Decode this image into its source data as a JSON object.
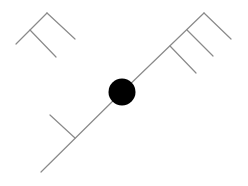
{
  "diagram": {
    "type": "wind-barb-station-model",
    "background": "#ffffff",
    "line_color": "#8a8a8a",
    "station": {
      "cx": 122,
      "cy": 92,
      "r": 13.5,
      "fill": "#000000",
      "shape": "filled-circle"
    },
    "barbs": [
      {
        "name": "upper-left-barb",
        "shaft": [
          16,
          44,
          47,
          13
        ],
        "ticks": [
          [
            47,
            13,
            75,
            39
          ],
          [
            30,
            30,
            56,
            57
          ]
        ]
      },
      {
        "name": "upper-right-barb",
        "shaft": [
          122,
          92,
          204,
          13
        ],
        "ticks": [
          [
            204,
            13,
            231,
            39
          ],
          [
            187,
            30,
            213,
            56
          ],
          [
            170,
            46,
            196,
            73
          ]
        ]
      },
      {
        "name": "lower-left-barb",
        "shaft": [
          122,
          92,
          41,
          172
        ],
        "ticks": [
          [
            75,
            138,
            50,
            115
          ]
        ]
      }
    ]
  }
}
